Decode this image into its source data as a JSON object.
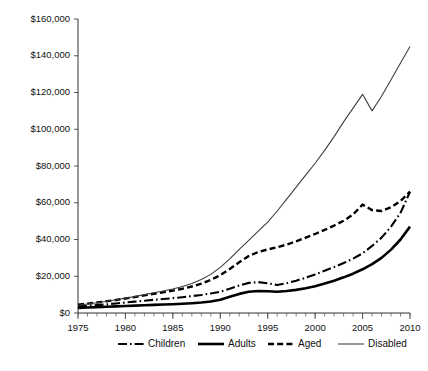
{
  "chart_data": {
    "type": "line",
    "title": "",
    "subtitle": "",
    "xlabel": "",
    "ylabel": "",
    "xlim": [
      1975,
      2010
    ],
    "ylim": [
      0,
      160000
    ],
    "grid": false,
    "legend_position": "bottom",
    "x_ticks": [
      1975,
      1980,
      1985,
      1990,
      1995,
      2000,
      2005,
      2010
    ],
    "x_tick_labels": [
      "1975",
      "1980",
      "1985",
      "1990",
      "1995",
      "2000",
      "2005",
      "2010"
    ],
    "x_minor_tick_interval": 1,
    "y_ticks": [
      0,
      20000,
      40000,
      60000,
      80000,
      100000,
      120000,
      140000,
      160000
    ],
    "y_tick_labels": [
      "$0",
      "$20,000",
      "$40,000",
      "$60,000",
      "$80,000",
      "$100,000",
      "$120,000",
      "$140,000",
      "$160,000"
    ],
    "x": [
      1975,
      1976,
      1977,
      1978,
      1979,
      1980,
      1981,
      1982,
      1983,
      1984,
      1985,
      1986,
      1987,
      1988,
      1989,
      1990,
      1991,
      1992,
      1993,
      1994,
      1995,
      1996,
      1997,
      1998,
      1999,
      2000,
      2001,
      2002,
      2003,
      2004,
      2005,
      2006,
      2007,
      2008,
      2009,
      2010
    ],
    "series": [
      {
        "name": "Children",
        "line_style": "dash-dot",
        "color": "#000000",
        "values": [
          3500,
          3900,
          4300,
          4700,
          5200,
          5700,
          6200,
          6700,
          7200,
          7600,
          8100,
          8600,
          9200,
          9800,
          10600,
          11600,
          13200,
          15000,
          16400,
          16800,
          16200,
          15200,
          16200,
          17600,
          19200,
          21000,
          23000,
          25000,
          27200,
          29600,
          32500,
          36500,
          41000,
          47000,
          54500,
          66000
        ]
      },
      {
        "name": "Adults",
        "line_style": "solid-thick",
        "color": "#000000",
        "values": [
          2800,
          3000,
          3200,
          3400,
          3600,
          3800,
          4000,
          4200,
          4400,
          4600,
          4800,
          5000,
          5300,
          5700,
          6300,
          7200,
          8800,
          10400,
          11600,
          12000,
          11800,
          11600,
          12000,
          12600,
          13500,
          14600,
          16000,
          17600,
          19400,
          21400,
          23800,
          26600,
          30000,
          34500,
          40000,
          47000
        ]
      },
      {
        "name": "Aged",
        "line_style": "dashed",
        "color": "#000000",
        "values": [
          4500,
          5100,
          5700,
          6400,
          7100,
          7900,
          8700,
          9600,
          10500,
          11300,
          12200,
          13200,
          14400,
          16000,
          18000,
          20600,
          24000,
          27600,
          31000,
          33200,
          34600,
          35800,
          37200,
          39000,
          41000,
          43000,
          45200,
          47600,
          50200,
          53600,
          59000,
          56000,
          55500,
          57500,
          61000,
          66000
        ]
      },
      {
        "name": "Disabled",
        "line_style": "solid-thin",
        "color": "#3a3a3a",
        "values": [
          4200,
          4900,
          5600,
          6400,
          7200,
          8100,
          9000,
          10000,
          11000,
          12000,
          13100,
          14400,
          16000,
          18200,
          21000,
          24800,
          29500,
          34600,
          39500,
          44500,
          49500,
          55500,
          62000,
          68500,
          75000,
          81500,
          88500,
          96000,
          104000,
          111500,
          119000,
          110000,
          118000,
          127000,
          136000,
          145000
        ]
      }
    ]
  },
  "legend": {
    "items": [
      {
        "label": "Children",
        "style": "dash-dot"
      },
      {
        "label": "Adults",
        "style": "solid-thick"
      },
      {
        "label": "Aged",
        "style": "dashed"
      },
      {
        "label": "Disabled",
        "style": "solid-thin"
      }
    ]
  }
}
